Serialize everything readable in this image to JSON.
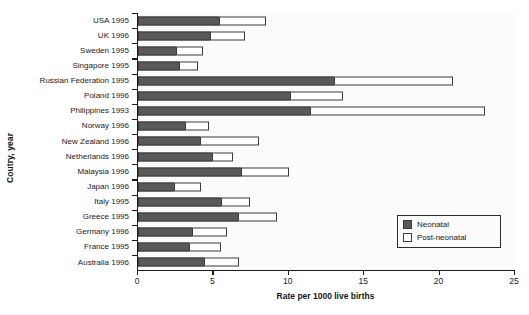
{
  "chart_data": {
    "type": "bar",
    "orientation": "horizontal",
    "stacked": true,
    "title": "",
    "xlabel": "Rate per 1000 live births",
    "ylabel": "Coutry, year",
    "xlim": [
      0,
      25
    ],
    "xticks": [
      "0",
      "5",
      "10",
      "15",
      "20",
      "25"
    ],
    "grid": false,
    "legend_position": "inside-bottom-right",
    "categories": [
      "USA 1995",
      "UK 1996",
      "Sweden 1995",
      "Singapore 1995",
      "Russian Federation 1995",
      "Poland 1996",
      "Philippines 1993",
      "Norway 1996",
      "New Zealand 1996",
      "Netherlands 1996",
      "Malaysia 1996",
      "Japan 1996",
      "Italy 1995",
      "Greece 1995",
      "Germany 1996",
      "France 1995",
      "Australia 1996"
    ],
    "series": [
      {
        "name": "Neonatal",
        "color": "#595959",
        "values": [
          5.4,
          4.8,
          2.5,
          2.7,
          13.0,
          10.1,
          11.4,
          3.1,
          4.1,
          4.9,
          6.8,
          2.4,
          5.5,
          6.6,
          3.6,
          3.4,
          4.4
        ]
      },
      {
        "name": "Post-neonatal",
        "color": "#ffffff",
        "values": [
          3.1,
          2.3,
          1.8,
          1.3,
          7.9,
          3.5,
          11.6,
          1.6,
          3.9,
          1.4,
          3.2,
          1.8,
          1.9,
          2.6,
          2.3,
          2.1,
          2.3
        ]
      }
    ],
    "totals": [
      8.5,
      7.1,
      4.3,
      4.0,
      20.9,
      13.6,
      23.0,
      4.7,
      8.0,
      6.3,
      10.0,
      4.2,
      7.4,
      9.2,
      5.9,
      5.5,
      6.7
    ]
  },
  "legend": {
    "items": [
      {
        "label": "Neonatal",
        "swatch": "filled-dark-square"
      },
      {
        "label": "Post-neonatal",
        "swatch": "empty-white-square"
      }
    ]
  }
}
